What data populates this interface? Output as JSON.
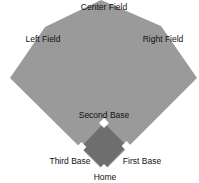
{
  "diagram": {
    "colors": {
      "outfield": "#9a9a9a",
      "infield": "#6e6e6e",
      "base": "#ffffff",
      "background": "#ffffff",
      "text": "#111111"
    },
    "labels": {
      "center_field": "Center Field",
      "left_field": "Left Field",
      "right_field": "Right Field",
      "second_base": "Second Base",
      "third_base": "Third Base",
      "first_base": "First Base",
      "home": "Home"
    }
  }
}
